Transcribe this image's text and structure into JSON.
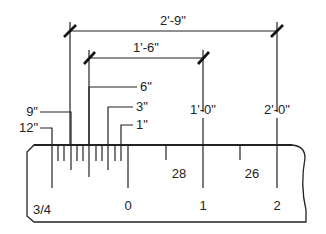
{
  "diagram": {
    "scale_label": "3/4",
    "dimensions": [
      {
        "id": "dim-2-9",
        "label": "2'-9\"",
        "x1": 70,
        "x2": 277,
        "y": 31
      },
      {
        "id": "dim-1-6",
        "label": "1'-6\"",
        "x1": 89,
        "x2": 203,
        "y": 58
      }
    ],
    "callouts": [
      {
        "id": "callout-12in",
        "label": "12\"",
        "tick_x": 52,
        "y": 128,
        "side": "left"
      },
      {
        "id": "callout-9in",
        "label": "9\"",
        "tick_x": 71,
        "y": 112,
        "side": "left"
      },
      {
        "id": "callout-6in",
        "label": "6\"",
        "tick_x": 89,
        "y": 87,
        "side": "right"
      },
      {
        "id": "callout-3in",
        "label": "3\"",
        "tick_x": 108,
        "y": 107,
        "side": "right"
      },
      {
        "id": "callout-1in",
        "label": "1\"",
        "tick_x": 121,
        "y": 125,
        "side": "right"
      }
    ],
    "foot_labels": [
      {
        "id": "label-1-0",
        "label": "1'-0\"",
        "x": 203
      },
      {
        "id": "label-2-0",
        "label": "2'-0\"",
        "x": 277
      }
    ],
    "ruler_numbers": [
      {
        "id": "num-0",
        "label": "0",
        "x": 128,
        "y": 205
      },
      {
        "id": "num-1",
        "label": "1",
        "x": 203,
        "y": 205
      },
      {
        "id": "num-2",
        "label": "2",
        "x": 277,
        "y": 205
      },
      {
        "id": "num-28",
        "label": "28",
        "x": 179,
        "y": 175
      },
      {
        "id": "num-26",
        "label": "26",
        "x": 252,
        "y": 175
      }
    ],
    "colors": {
      "line": "#222222",
      "background": "#ffffff"
    }
  }
}
